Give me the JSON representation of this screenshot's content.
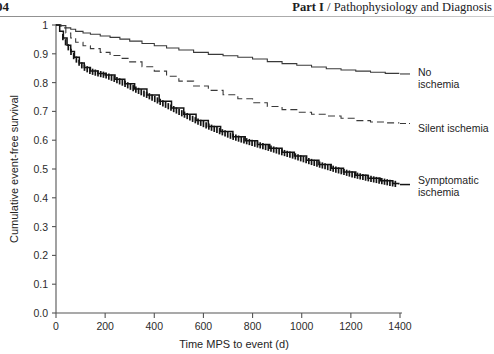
{
  "running_head": {
    "folio": "04",
    "part_label": "Part I",
    "separator": " / ",
    "title": "Pathophysiology and Diagnosis",
    "full_text": "Part I / Pathophysiology and Diagnosis"
  },
  "chart_data": {
    "type": "line",
    "title": "",
    "xlabel": "Time MPS to event (d)",
    "ylabel": "Cumulative event-free survival",
    "xlim": [
      0,
      1400
    ],
    "ylim": [
      0,
      1
    ],
    "xticks": [
      0,
      200,
      400,
      600,
      800,
      1000,
      1200,
      1400
    ],
    "xtick_labels": [
      "0",
      "200",
      "400",
      "600",
      "800",
      "1000",
      "1200",
      "1400"
    ],
    "yticks": [
      0,
      0.1,
      0.2,
      0.3,
      0.4,
      0.5,
      0.6,
      0.7,
      0.8,
      0.9,
      1
    ],
    "ytick_labels": [
      "0.0",
      "0.1",
      "0.2",
      "0.3",
      "0.4",
      "0.5",
      "0.6",
      "0.7",
      "0.8",
      "0.9",
      "1"
    ],
    "grid": false,
    "legend_position": "right-inline",
    "series": [
      {
        "name": "No ischemia",
        "label_lines": [
          "No",
          "ischemia"
        ],
        "style": "solid",
        "color": "#3a3a3a",
        "censor_marks": false,
        "x": [
          0,
          20,
          40,
          60,
          80,
          110,
          140,
          180,
          220,
          260,
          300,
          350,
          400,
          450,
          500,
          560,
          620,
          680,
          740,
          800,
          860,
          920,
          980,
          1040,
          1100,
          1160,
          1220,
          1280,
          1340,
          1395
        ],
        "y": [
          1.0,
          0.998,
          0.99,
          0.985,
          0.978,
          0.972,
          0.968,
          0.962,
          0.957,
          0.951,
          0.944,
          0.936,
          0.928,
          0.92,
          0.913,
          0.905,
          0.898,
          0.893,
          0.888,
          0.882,
          0.873,
          0.866,
          0.86,
          0.854,
          0.848,
          0.844,
          0.84,
          0.836,
          0.832,
          0.83
        ]
      },
      {
        "name": "Silent ischemia",
        "label_lines": [
          "Silent ischemia"
        ],
        "style": "dashed",
        "color": "#3a3a3a",
        "censor_marks": false,
        "x": [
          0,
          20,
          40,
          60,
          80,
          110,
          140,
          180,
          220,
          260,
          300,
          350,
          400,
          450,
          500,
          560,
          620,
          680,
          740,
          800,
          860,
          920,
          980,
          1040,
          1100,
          1160,
          1220,
          1280,
          1340,
          1395
        ],
        "y": [
          1.0,
          0.99,
          0.972,
          0.955,
          0.94,
          0.928,
          0.918,
          0.905,
          0.894,
          0.884,
          0.872,
          0.855,
          0.84,
          0.822,
          0.805,
          0.788,
          0.773,
          0.758,
          0.744,
          0.73,
          0.717,
          0.706,
          0.697,
          0.69,
          0.684,
          0.676,
          0.668,
          0.663,
          0.66,
          0.658
        ]
      },
      {
        "name": "Symptomatic ischemia",
        "label_lines": [
          "Symptomatic",
          "ischemia"
        ],
        "style": "solid-censored",
        "color": "#141414",
        "censor_marks": true,
        "x": [
          0,
          15,
          30,
          45,
          60,
          75,
          95,
          115,
          140,
          170,
          200,
          240,
          280,
          320,
          370,
          420,
          470,
          520,
          570,
          620,
          670,
          720,
          770,
          820,
          870,
          920,
          970,
          1020,
          1070,
          1120,
          1170,
          1220,
          1270,
          1320,
          1370,
          1395
        ],
        "y": [
          1.0,
          0.978,
          0.955,
          0.93,
          0.908,
          0.888,
          0.868,
          0.852,
          0.84,
          0.832,
          0.826,
          0.812,
          0.796,
          0.778,
          0.757,
          0.735,
          0.712,
          0.69,
          0.668,
          0.648,
          0.63,
          0.612,
          0.598,
          0.585,
          0.572,
          0.558,
          0.545,
          0.53,
          0.516,
          0.503,
          0.49,
          0.478,
          0.468,
          0.459,
          0.45,
          0.446
        ]
      }
    ]
  }
}
